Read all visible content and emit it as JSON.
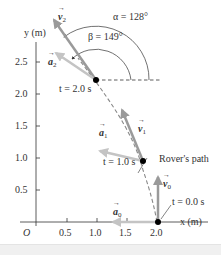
{
  "diagram": {
    "title": "Rover's path",
    "axes": {
      "x_label": "x (m)",
      "y_label": "y (m)",
      "origin_label": "O",
      "x_ticks": [
        "0.5",
        "1.0",
        "1.5",
        "2.0"
      ],
      "y_ticks": [
        "0.5",
        "1.0",
        "1.5",
        "2.0",
        "2.5"
      ]
    },
    "points": [
      {
        "t_label": "t = 0.0 s",
        "x": 2.0,
        "y": 0.0,
        "velocity_label": "v",
        "velocity_sub": "0",
        "accel_label": "a",
        "accel_sub": "0"
      },
      {
        "t_label": "t = 1.0 s",
        "x": 1.7,
        "y": 0.95,
        "velocity_label": "v",
        "velocity_sub": "1",
        "accel_label": "a",
        "accel_sub": "1"
      },
      {
        "t_label": "t = 2.0 s",
        "x": 1.0,
        "y": 2.2,
        "velocity_label": "v",
        "velocity_sub": "2",
        "accel_label": "a",
        "accel_sub": "2"
      }
    ],
    "angles": {
      "alpha": "α = 128°",
      "beta": "β = 149°"
    },
    "path_label": "Rover's path",
    "colors": {
      "axis": "#333333",
      "path": "#888888",
      "velocity": "#9a9a9a",
      "acceleration": "#bdbdbd",
      "point": "#000000"
    }
  }
}
